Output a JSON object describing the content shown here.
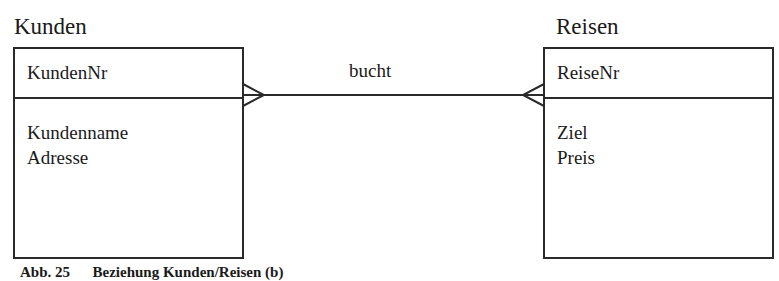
{
  "entities": [
    {
      "name": "Kunden",
      "key": "KundenNr",
      "attributes": [
        "Kundenname",
        "Adresse"
      ]
    },
    {
      "name": "Reisen",
      "key": "ReiseNr",
      "attributes": [
        "Ziel",
        "Preis"
      ]
    }
  ],
  "relationship": {
    "label": "bucht",
    "from": "Kunden",
    "to": "Reisen",
    "cardinality_from": "many",
    "cardinality_to": "many"
  },
  "caption": "Abb. 25      Beziehung Kunden/Reisen (b)"
}
